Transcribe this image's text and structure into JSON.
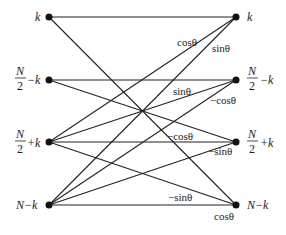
{
  "diagram": {
    "type": "butterfly-flow-graph",
    "left_nodes": [
      {
        "id": "L0",
        "label": "k",
        "x": 49,
        "y": 17
      },
      {
        "id": "L1",
        "label_num": "N",
        "label_den": "2",
        "label_suffix": "−k",
        "x": 49,
        "y": 80
      },
      {
        "id": "L2",
        "label_num": "N",
        "label_den": "2",
        "label_suffix": "+k",
        "x": 49,
        "y": 142
      },
      {
        "id": "L3",
        "label": "N−k",
        "x": 49,
        "y": 205
      }
    ],
    "right_nodes": [
      {
        "id": "R0",
        "label": "k",
        "x": 236,
        "y": 17
      },
      {
        "id": "R1",
        "label_num": "N",
        "label_den": "2",
        "label_suffix": "−k",
        "x": 236,
        "y": 80
      },
      {
        "id": "R2",
        "label_num": "N",
        "label_den": "2",
        "label_suffix": "+k",
        "x": 236,
        "y": 142
      },
      {
        "id": "R3",
        "label": "N−k",
        "x": 236,
        "y": 205
      }
    ],
    "edges": [
      {
        "from": "L0",
        "to": "R0"
      },
      {
        "from": "L0",
        "to": "R3"
      },
      {
        "from": "L1",
        "to": "R1"
      },
      {
        "from": "L1",
        "to": "R2"
      },
      {
        "from": "L2",
        "to": "R0"
      },
      {
        "from": "L2",
        "to": "R1"
      },
      {
        "from": "L2",
        "to": "R2"
      },
      {
        "from": "L2",
        "to": "R3"
      },
      {
        "from": "L3",
        "to": "R0"
      },
      {
        "from": "L3",
        "to": "R1"
      },
      {
        "from": "L3",
        "to": "R2"
      },
      {
        "from": "L3",
        "to": "R3"
      }
    ],
    "edge_labels": [
      {
        "text": "cosθ",
        "x": 175,
        "y": 45
      },
      {
        "text": "sinθ",
        "x": 210,
        "y": 51
      },
      {
        "text": "sinθ",
        "x": 173,
        "y": 95
      },
      {
        "text": "−cosθ",
        "x": 210,
        "y": 104
      },
      {
        "text": "−cosθ",
        "x": 168,
        "y": 140
      },
      {
        "text": "−sinθ",
        "x": 208,
        "y": 155
      },
      {
        "text": "−sinθ",
        "x": 168,
        "y": 202
      },
      {
        "text": "cosθ",
        "x": 214,
        "y": 220
      }
    ]
  },
  "labels": {
    "left_k": "k",
    "left_n2_minus_k_num": "N",
    "left_n2_minus_k_den": "2",
    "left_n2_minus_k_suffix": "−k",
    "left_n2_plus_k_num": "N",
    "left_n2_plus_k_den": "2",
    "left_n2_plus_k_suffix": "+k",
    "left_n_minus_k": "N−k",
    "right_k": "k",
    "right_n2_minus_k_num": "N",
    "right_n2_minus_k_den": "2",
    "right_n2_minus_k_suffix": "−k",
    "right_n2_plus_k_num": "N",
    "right_n2_plus_k_den": "2",
    "right_n2_plus_k_suffix": "+k",
    "right_n_minus_k": "N−k",
    "w_cos_top": "cosθ",
    "w_sin_top": "sinθ",
    "w_sin_mid": "sinθ",
    "w_negcos_mid": "−cosθ",
    "w_negcos_low": "−cosθ",
    "w_negsin_low": "−sinθ",
    "w_negsin_bot": "−sinθ",
    "w_cos_bot": "cosθ"
  }
}
